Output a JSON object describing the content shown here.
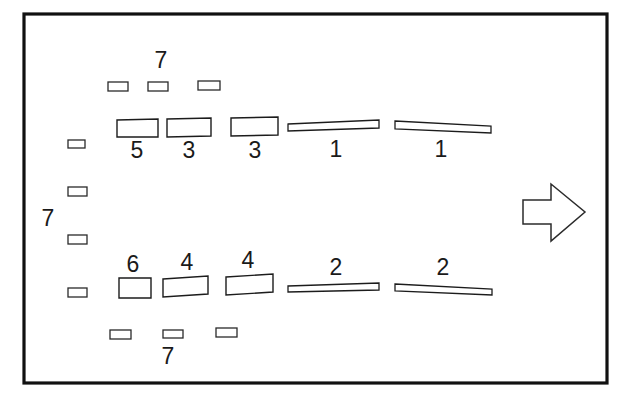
{
  "figure": {
    "type": "patent-line-drawing",
    "title": "",
    "background_color": "#ffffff",
    "line_color": "#1c1c1c",
    "frame": {
      "name": "drawing-border",
      "x": 24,
      "y": 14,
      "width": 583,
      "height": 369,
      "stroke_width": 3.2
    },
    "reference_numerals": [
      {
        "label": "7",
        "x": 161,
        "y": 68,
        "position": "top-center"
      },
      {
        "label": "5",
        "x": 137,
        "y": 158,
        "position": "below-block"
      },
      {
        "label": "3",
        "x": 189,
        "y": 158,
        "position": "below-block"
      },
      {
        "label": "3",
        "x": 255,
        "y": 158,
        "position": "below-block"
      },
      {
        "label": "1",
        "x": 336,
        "y": 157,
        "position": "below-bar"
      },
      {
        "label": "1",
        "x": 441,
        "y": 157,
        "position": "below-bar"
      },
      {
        "label": "7",
        "x": 48,
        "y": 226,
        "position": "left-center"
      },
      {
        "label": "6",
        "x": 133,
        "y": 276,
        "position": "above-block"
      },
      {
        "label": "4",
        "x": 187,
        "y": 276,
        "position": "above-block"
      },
      {
        "label": "4",
        "x": 248,
        "y": 276,
        "position": "above-block"
      },
      {
        "label": "2",
        "x": 336,
        "y": 275,
        "position": "above-bar"
      },
      {
        "label": "2",
        "x": 443,
        "y": 275,
        "position": "above-bar"
      },
      {
        "label": "7",
        "x": 168,
        "y": 364,
        "position": "bottom-center"
      }
    ],
    "chips_top_row": [
      {
        "name": "chip-top-1",
        "x": 108,
        "y": 82,
        "width": 20,
        "height": 9
      },
      {
        "name": "chip-top-2",
        "x": 148,
        "y": 82,
        "width": 20,
        "height": 9
      },
      {
        "name": "chip-top-3",
        "x": 198,
        "y": 81,
        "width": 22,
        "height": 9
      }
    ],
    "chips_left_column": [
      {
        "name": "chip-left-1",
        "x": 68,
        "y": 140,
        "width": 17,
        "height": 8
      },
      {
        "name": "chip-left-2",
        "x": 68,
        "y": 187,
        "width": 19,
        "height": 9
      },
      {
        "name": "chip-left-3",
        "x": 68,
        "y": 235,
        "width": 19,
        "height": 9
      },
      {
        "name": "chip-left-4",
        "x": 68,
        "y": 288,
        "width": 19,
        "height": 9
      }
    ],
    "chips_bottom_row": [
      {
        "name": "chip-bottom-1",
        "x": 110,
        "y": 330,
        "width": 21,
        "height": 9
      },
      {
        "name": "chip-bottom-2",
        "x": 163,
        "y": 330,
        "width": 20,
        "height": 8
      },
      {
        "name": "chip-bottom-3",
        "x": 216,
        "y": 328,
        "width": 21,
        "height": 9
      }
    ],
    "blocks_upper": [
      {
        "name": "block-5",
        "numeral": "5",
        "x": 117,
        "y": 119,
        "width": 41,
        "height": 18
      },
      {
        "name": "block-3a",
        "numeral": "3",
        "x": 167,
        "y": 118,
        "width": 44,
        "height": 19
      },
      {
        "name": "block-3b",
        "numeral": "3",
        "x": 231,
        "y": 117,
        "width": 47,
        "height": 19
      }
    ],
    "blocks_lower": [
      {
        "name": "block-6",
        "numeral": "6",
        "x": 119,
        "y": 277,
        "width": 32,
        "height": 21
      },
      {
        "name": "block-4a",
        "numeral": "4",
        "x": 163,
        "y": 276,
        "width": 45,
        "height": 21
      },
      {
        "name": "block-4b",
        "numeral": "4",
        "x": 226,
        "y": 274,
        "width": 47,
        "height": 21
      }
    ],
    "bars_upper": [
      {
        "name": "bar-1a",
        "numeral": "1",
        "x1": 288,
        "y1": 123,
        "x2": 379,
        "y2": 121,
        "thickness": 8
      },
      {
        "name": "bar-1b",
        "numeral": "1",
        "x1": 395,
        "y1": 121,
        "x2": 491,
        "y2": 125,
        "thickness": 8
      }
    ],
    "bars_lower": [
      {
        "name": "bar-2a",
        "numeral": "2",
        "x1": 288,
        "y1": 285,
        "x2": 379,
        "y2": 283,
        "thickness": 7
      },
      {
        "name": "bar-2b",
        "numeral": "2",
        "x1": 395,
        "y1": 284,
        "x2": 492,
        "y2": 288,
        "thickness": 7
      }
    ],
    "arrow": {
      "name": "direction-arrow",
      "direction": "right",
      "x": 523,
      "y": 184,
      "width": 62,
      "height": 57
    }
  }
}
